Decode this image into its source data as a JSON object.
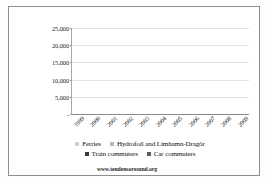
{
  "chart_data": {
    "type": "bar",
    "stacked": true,
    "title": "",
    "subtitle": "",
    "xlabel": "",
    "ylabel": "",
    "grid": true,
    "legend_position": "bottom",
    "ylim": [
      0,
      25000
    ],
    "ytick_labels": [
      "25,000",
      "20,000",
      "15,000",
      "10,000",
      "5,000",
      "-"
    ],
    "ytick_values": [
      25000,
      20000,
      15000,
      10000,
      5000,
      0
    ],
    "categories": [
      "1999",
      "2000",
      "2001",
      "2002",
      "2003",
      "2004",
      "2005",
      "2006",
      "2007",
      "2008",
      "2009"
    ],
    "series": [
      {
        "name": "Car commuters",
        "color": "#3a3a3a",
        "values": [
          900,
          1700,
          2300,
          3300,
          3800,
          5100,
          6200,
          9500,
          12700,
          13300,
          13500
        ]
      },
      {
        "name": "Train commuters",
        "color": "#5c5c5c",
        "values": [
          0,
          300,
          500,
          700,
          1000,
          1400,
          2100,
          2700,
          3500,
          4000,
          4300
        ]
      },
      {
        "name": "Hydrofoil and Limhamn-Dragör",
        "color": "#b9b9b9",
        "values": [
          500,
          500,
          500,
          500,
          500,
          600,
          800,
          500,
          900,
          1300,
          1100
        ]
      },
      {
        "name": "Ferries",
        "color": "#cfcfcf",
        "values": [
          400,
          400,
          400,
          400,
          400,
          400,
          400,
          400,
          1000,
          900,
          900
        ]
      }
    ],
    "totals": [
      1800,
      2900,
      3700,
      4900,
      5700,
      7500,
      9500,
      13100,
      18100,
      19500,
      19800
    ]
  },
  "legend": {
    "rows": [
      [
        {
          "label": "Ferries",
          "color": "#cfcfcf"
        },
        {
          "label": "Hydrofoil and Limhamn-Dragör",
          "color": "#b9b9b9"
        }
      ],
      [
        {
          "label": "Train commuters",
          "color": "#3a3a3a"
        },
        {
          "label": "Car commuters",
          "color": "#5c5c5c"
        }
      ]
    ]
  },
  "footer": {
    "url": "www.tendensoresund.org"
  }
}
